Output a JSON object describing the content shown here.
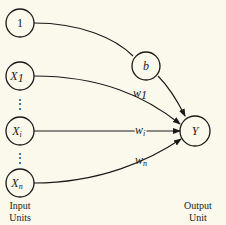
{
  "diagram": {
    "type": "perceptron",
    "input_nodes": [
      {
        "id": "bias-input",
        "label": "1"
      },
      {
        "id": "x1",
        "label": "X",
        "sub": "1"
      },
      {
        "id": "xi",
        "label": "X",
        "sub": "i"
      },
      {
        "id": "xn",
        "label": "X",
        "sub": "n"
      }
    ],
    "bias_node": {
      "label": "b"
    },
    "output_node": {
      "label": "Y"
    },
    "weights": [
      {
        "label": "w",
        "sub": "1"
      },
      {
        "label": "w",
        "sub": "i"
      },
      {
        "label": "w",
        "sub": "n"
      }
    ],
    "ellipsis": "⋮",
    "captions": {
      "input_line1": "Input",
      "input_line2": "Units",
      "output_line1": "Output",
      "output_line2": "Unit"
    }
  }
}
